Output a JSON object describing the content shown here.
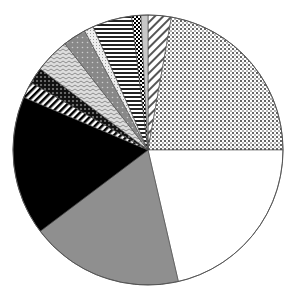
{
  "chart_data": {
    "type": "pie",
    "title": "",
    "start_angle_deg": 0,
    "direction": "clockwise",
    "center": [
      148,
      150
    ],
    "radius": 135,
    "slices": [
      {
        "pattern": "diagonal-hatch-light",
        "start": 0,
        "end": 10,
        "percent": 2.8
      },
      {
        "pattern": "dotted",
        "start": 10,
        "end": 90,
        "percent": 22.2
      },
      {
        "pattern": "white",
        "start": 90,
        "end": 167,
        "percent": 21.4
      },
      {
        "pattern": "gray",
        "start": 167,
        "end": 233,
        "percent": 18.3
      },
      {
        "pattern": "black",
        "start": 233,
        "end": 293,
        "percent": 16.7
      },
      {
        "pattern": "diagonal-stripes",
        "start": 293,
        "end": 300,
        "percent": 1.9
      },
      {
        "pattern": "dark-check",
        "start": 300,
        "end": 307,
        "percent": 1.9
      },
      {
        "pattern": "zigzag",
        "start": 307,
        "end": 322,
        "percent": 4.2
      },
      {
        "pattern": "gray-dots",
        "start": 322,
        "end": 332,
        "percent": 2.8
      },
      {
        "pattern": "light-texture",
        "start": 332,
        "end": 336,
        "percent": 1.1
      },
      {
        "pattern": "horizontal-stripes",
        "start": 336,
        "end": 353,
        "percent": 4.7
      },
      {
        "pattern": "checker",
        "start": 353,
        "end": 357,
        "percent": 1.1
      },
      {
        "pattern": "light-gray",
        "start": 357,
        "end": 360,
        "percent": 0.8
      }
    ],
    "legend": []
  }
}
